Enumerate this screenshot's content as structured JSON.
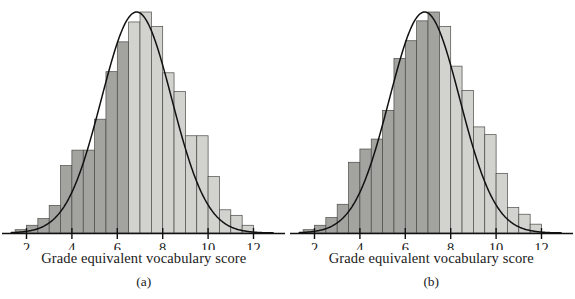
{
  "figure": {
    "title": "",
    "panel_count": 2
  },
  "colors": {
    "bar_light": "#d2d2ce",
    "bar_dark": "#a3a39f",
    "bar_stroke": "#4a4a48",
    "curve": "#111111",
    "axis": "#111111",
    "text": "#1a1a1a",
    "background": "#ffffff"
  },
  "chart_data": [
    {
      "type": "bar",
      "panel_id": "a",
      "caption": "(a)",
      "title": "",
      "xlabel": "Grade equivalent vocabulary score",
      "ylabel": "",
      "xlim": [
        1.3,
        12.9
      ],
      "ylim": [
        0,
        100
      ],
      "grid": false,
      "legend": "none",
      "xticks": [
        2,
        4,
        6,
        8,
        10,
        12
      ],
      "xticklabels": [
        "2",
        "4",
        "6",
        "8",
        "10",
        "12"
      ],
      "bin_width": 0.5,
      "bin_starts": [
        1.5,
        2.0,
        2.5,
        3.0,
        3.5,
        4.0,
        4.5,
        5.0,
        5.5,
        6.0,
        6.5,
        7.0,
        7.5,
        8.0,
        8.5,
        9.0,
        9.5,
        10.0,
        10.5,
        11.0,
        11.5
      ],
      "categories": [
        "1.5-2.0",
        "2.0-2.5",
        "2.5-3.0",
        "3.0-3.5",
        "3.5-4.0",
        "4.0-4.5",
        "4.5-5.0",
        "5.0-5.5",
        "5.5-6.0",
        "6.0-6.5",
        "6.5-7.0",
        "7.0-7.5",
        "7.5-8.0",
        "8.0-8.5",
        "8.5-9.0",
        "9.0-9.5",
        "9.5-10.0",
        "10.0-10.5",
        "10.5-11.0",
        "11.0-11.5",
        "11.5-12.0"
      ],
      "values": [
        1.5,
        3.5,
        6.5,
        12.5,
        30.5,
        37.5,
        37.5,
        51.5,
        73.0,
        86.5,
        95.5,
        100.0,
        93.5,
        72.5,
        64.0,
        44.0,
        44.0,
        25.5,
        10.5,
        8.0,
        3.5
      ],
      "shaded_through_bin": 9,
      "curve": {
        "kind": "normal-density",
        "mean": 6.85,
        "sd": 1.55,
        "peak_value": 100.0
      },
      "annotations": []
    },
    {
      "type": "bar",
      "panel_id": "b",
      "caption": "(b)",
      "title": "",
      "xlabel": "Grade equivalent vocabulary score",
      "ylabel": "",
      "xlim": [
        1.3,
        12.9
      ],
      "ylim": [
        0,
        100
      ],
      "grid": false,
      "legend": "none",
      "xticks": [
        2,
        4,
        6,
        8,
        10,
        12
      ],
      "xticklabels": [
        "2",
        "4",
        "6",
        "8",
        "10",
        "12"
      ],
      "bin_width": 0.5,
      "bin_starts": [
        1.5,
        2.0,
        2.5,
        3.0,
        3.5,
        4.0,
        4.5,
        5.0,
        5.5,
        6.0,
        6.5,
        7.0,
        7.5,
        8.0,
        8.5,
        9.0,
        9.5,
        10.0,
        10.5,
        11.0,
        11.5
      ],
      "categories": [
        "1.5-2.0",
        "2.0-2.5",
        "2.5-3.0",
        "3.0-3.5",
        "3.5-4.0",
        "4.0-4.5",
        "4.5-5.0",
        "5.0-5.5",
        "5.5-6.0",
        "6.0-6.5",
        "6.5-7.0",
        "7.0-7.5",
        "7.5-8.0",
        "8.0-8.5",
        "8.5-9.0",
        "9.0-9.5",
        "9.5-10.0",
        "10.0-10.5",
        "10.5-11.0",
        "11.0-11.5",
        "11.5-12.0"
      ],
      "values": [
        1.5,
        3.5,
        7.0,
        13.0,
        32.0,
        38.0,
        42.5,
        55.5,
        79.0,
        87.0,
        96.0,
        100.0,
        93.5,
        75.5,
        64.5,
        48.0,
        44.5,
        27.0,
        11.5,
        8.5,
        4.0
      ],
      "shaded_through_bin": 11,
      "curve": {
        "kind": "normal-density",
        "mean": 6.85,
        "sd": 1.55,
        "peak_value": 100.0
      },
      "annotations": []
    }
  ]
}
